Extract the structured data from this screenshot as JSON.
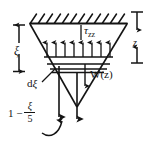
{
  "figure": {
    "background_color": "#ffffff",
    "line_color": "#141414",
    "width": 154,
    "height": 149
  },
  "labels": {
    "stress_symbol": "τ",
    "stress_subscript": "zz",
    "weight": "W(z)",
    "depth_right": "z",
    "depth_left": "ξ",
    "slab_thickness_d": "d",
    "slab_thickness_xi": "ξ",
    "formula_lead": "1 −",
    "formula_numerator": "ξ",
    "formula_denominator": "5"
  },
  "geometry": {
    "hatch_strokes": 12,
    "stress_arrows": 8,
    "slab_lines": 3,
    "long_down_arrows": 2,
    "funnel_shape": "inverted-trapezoid-with-v-vertex"
  },
  "icons": {
    "up_arrow": "stress-up-arrow",
    "down_arrow": "weight-down-arrow",
    "curved_arrow": "curved-reference-arrow",
    "dimension_line": "dimension-line"
  }
}
